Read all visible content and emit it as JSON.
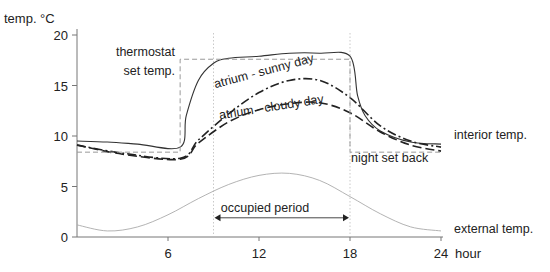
{
  "chart_data": {
    "type": "line",
    "title": "",
    "ylabel": "temp. °C",
    "xlabel": "hour",
    "xlim": [
      0,
      24
    ],
    "ylim": [
      0,
      20
    ],
    "x_ticks": [
      6,
      12,
      18,
      24
    ],
    "y_ticks": [
      0,
      5,
      10,
      15,
      20
    ],
    "series": [
      {
        "name": "interior temp.",
        "style": "solid",
        "x": [
          0,
          2,
          4,
          6.8,
          7.2,
          8,
          9,
          10,
          12,
          14,
          16,
          18,
          18.5,
          19,
          20,
          22,
          24
        ],
        "y": [
          9.5,
          9.4,
          9.2,
          8.9,
          12,
          15.5,
          17.2,
          17.7,
          17.9,
          18.2,
          18.2,
          17.9,
          14,
          12,
          10.5,
          9.4,
          9.2
        ]
      },
      {
        "name": "atrium - sunny day",
        "style": "dash-dot",
        "x": [
          0,
          3,
          6.8,
          8,
          10,
          12,
          14,
          16,
          18,
          20,
          22,
          24
        ],
        "y": [
          9.1,
          8.3,
          7.8,
          9.6,
          12.2,
          14.3,
          15.5,
          15.5,
          13.8,
          11,
          9.5,
          8.9
        ]
      },
      {
        "name": "atrium - cloudy day",
        "style": "dashed",
        "x": [
          0,
          3,
          6.8,
          8,
          10,
          12,
          14,
          16,
          18,
          20,
          22,
          24
        ],
        "y": [
          9.1,
          8.2,
          7.7,
          9.3,
          11.4,
          12.6,
          13.2,
          13.3,
          12.3,
          10.4,
          9.1,
          8.5
        ]
      },
      {
        "name": "thermostat set temp. / night set back",
        "style": "dashed-gray",
        "x": [
          0,
          6.8,
          6.8,
          18,
          18,
          24
        ],
        "y": [
          8.4,
          8.4,
          17.6,
          17.6,
          8.4,
          8.4
        ]
      },
      {
        "name": "external temp.",
        "style": "thin-gray",
        "x": [
          0,
          2,
          4,
          6,
          8,
          10,
          12,
          14,
          16,
          18,
          20,
          22,
          24
        ],
        "y": [
          1.2,
          0.6,
          1.0,
          2.2,
          3.8,
          5.2,
          6.1,
          6.3,
          5.6,
          4.0,
          2.3,
          1.0,
          0.6
        ]
      }
    ],
    "annotations": [
      {
        "text": "thermostat",
        "x": 5.5,
        "y": 17.8
      },
      {
        "text": "set temp.",
        "x": 5.5,
        "y": 16.2
      },
      {
        "text": "atrium - sunny day",
        "x": 12,
        "y": 14.6
      },
      {
        "text": "atrium - cloudy day",
        "x": 12,
        "y": 11.8
      },
      {
        "text": "interior temp.",
        "x": 25,
        "y": 10
      },
      {
        "text": "night set back",
        "x": 21,
        "y": 7.3
      },
      {
        "text": "occupied period",
        "x": 13.5,
        "y": 3.3
      },
      {
        "text": "external temp.",
        "x": 25,
        "y": 1.4
      }
    ],
    "occupied_period": [
      9,
      18
    ],
    "grid": false,
    "legend": "none"
  }
}
